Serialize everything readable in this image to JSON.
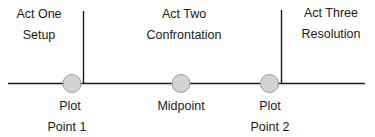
{
  "diagram": {
    "type": "three-act-structure",
    "colors": {
      "line": "#1a1a1a",
      "point_fill": "#d3d3d3",
      "point_stroke": "#9a9a9a",
      "text": "#1a1a1a"
    },
    "acts": [
      {
        "title": "Act One",
        "subtitle": "Setup"
      },
      {
        "title": "Act Two",
        "subtitle": "Confrontation"
      },
      {
        "title": "Act Three",
        "subtitle": "Resolution"
      }
    ],
    "points": [
      {
        "line1": "Plot",
        "line2": "Point 1"
      },
      {
        "line1": "Midpoint",
        "line2": ""
      },
      {
        "line1": "Plot",
        "line2": "Point 2"
      }
    ]
  }
}
